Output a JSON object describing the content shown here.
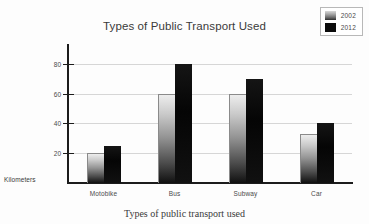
{
  "chart_data": {
    "type": "bar",
    "title": "Types of Public Transport Used",
    "xlabel": "Types of public transport used",
    "ylabel": "Kilometers",
    "categories": [
      "Motobike",
      "Bus",
      "Subway",
      "Car"
    ],
    "series": [
      {
        "name": "2002",
        "values": [
          20,
          60,
          60,
          33
        ],
        "color": "#a8a8a8"
      },
      {
        "name": "2012",
        "values": [
          25,
          80,
          70,
          40
        ],
        "color": "#0b0b0b"
      }
    ],
    "ylim": [
      0,
      88
    ],
    "yticks": [
      20,
      40,
      60,
      80
    ],
    "ytick_labels": [
      "20",
      "40",
      "60",
      "80"
    ],
    "grid": true,
    "legend_position": "top-right"
  },
  "legend": {
    "items": [
      {
        "label": "2002",
        "swatch": "gradient-gray-swatch"
      },
      {
        "label": "2012",
        "swatch": "black-swatch"
      }
    ]
  },
  "axis": {
    "y_unit_label": "Kilometers",
    "tick_20": "20",
    "tick_40": "40",
    "tick_60": "60",
    "tick_80": "80"
  }
}
